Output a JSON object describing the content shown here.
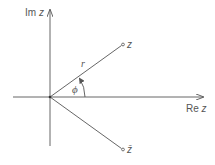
{
  "diagram": {
    "type": "complex-plane",
    "axes": {
      "imaginary_label_prefix": "Im",
      "imaginary_label_var": "z",
      "real_label_prefix": "Re",
      "real_label_var": "z"
    },
    "points": {
      "z_label": "z",
      "conjugate_label": "z̄"
    },
    "annotations": {
      "modulus_label": "r",
      "angle_label": "ϕ"
    },
    "colors": {
      "line": "#555555",
      "text": "#555555",
      "background": "#ffffff"
    }
  }
}
